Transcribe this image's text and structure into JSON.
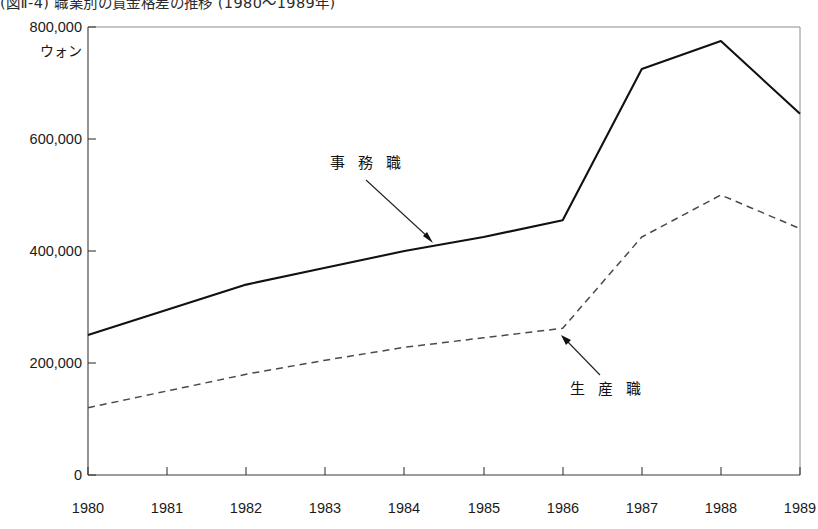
{
  "figure": {
    "title": "(図Ⅱ-4) 職業別の賃金格差の推移 (1980〜1989年)",
    "unit_label": "ウォン"
  },
  "annotations": {
    "clerical_label": "事 務 職",
    "production_label": "生 産 職"
  },
  "axis": {
    "y_ticks": [
      "800,000",
      "600,000",
      "400,000",
      "200,000",
      "0"
    ],
    "x_ticks": [
      "1980",
      "1981",
      "1982",
      "1983",
      "1984",
      "1985",
      "1986",
      "1987",
      "1988",
      "1989"
    ]
  },
  "colors": {
    "clerical_line": "#111111",
    "production_line": "#4a4a4a",
    "frame": "#8c8c8c",
    "axis": "#3a3a3a"
  },
  "chart_data": {
    "type": "line",
    "title": "(図Ⅱ-4) 職業別の賃金格差の推移 (1980〜1989年)",
    "xlabel": "",
    "ylabel": "ウォン",
    "x": [
      1980,
      1981,
      1982,
      1983,
      1984,
      1985,
      1986,
      1987,
      1988,
      1989
    ],
    "categories": [
      "1980",
      "1981",
      "1982",
      "1983",
      "1984",
      "1985",
      "1986",
      "1987",
      "1988",
      "1989"
    ],
    "ylim": [
      0,
      800000
    ],
    "ytick_values": [
      0,
      200000,
      400000,
      600000,
      800000
    ],
    "grid": false,
    "legend_position": "inline-annotation",
    "series": [
      {
        "name": "事務職",
        "style": "solid",
        "values": [
          250000,
          295000,
          340000,
          370000,
          400000,
          425000,
          455000,
          725000,
          775000,
          645000
        ]
      },
      {
        "name": "生産職",
        "style": "dashed",
        "values": [
          120000,
          150000,
          180000,
          205000,
          228000,
          245000,
          262000,
          425000,
          500000,
          440000
        ]
      }
    ]
  }
}
